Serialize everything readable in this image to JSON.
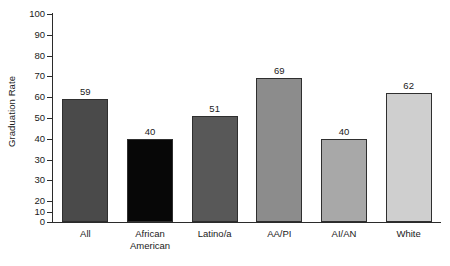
{
  "chart_data": {
    "type": "bar",
    "title": "",
    "xlabel": "",
    "ylabel": "Graduation Rate",
    "ylim": [
      0,
      100
    ],
    "grid": false,
    "legend": "none",
    "categories": [
      "All",
      "African American",
      "Latino/a",
      "AA/PI",
      "AI/AN",
      "White"
    ],
    "values": [
      59,
      40,
      51,
      69,
      40,
      62
    ],
    "value_labels": [
      "59",
      "40",
      "51",
      "69",
      "40",
      "62"
    ],
    "ytick_labels": [
      "100",
      "90",
      "80",
      "70",
      "60",
      "50",
      "40",
      "30",
      "30",
      "20",
      "10",
      "0"
    ],
    "ytick_positions": [
      100,
      90,
      80,
      70,
      60,
      50,
      40,
      30,
      20,
      10,
      5,
      0
    ],
    "bar_colors": [
      "#4a4a4a",
      "#070707",
      "#585858",
      "#8c8c8c",
      "#a8a8a8",
      "#cfcfcf"
    ],
    "bar_border_color": "#2f2f2f",
    "axis_color": "#2b2b2b",
    "background": "#ffffff"
  },
  "category_lines": [
    [
      "All",
      ""
    ],
    [
      "African",
      "American"
    ],
    [
      "Latino/a",
      ""
    ],
    [
      "AA/PI",
      ""
    ],
    [
      "AI/AN",
      ""
    ],
    [
      "White",
      ""
    ]
  ]
}
